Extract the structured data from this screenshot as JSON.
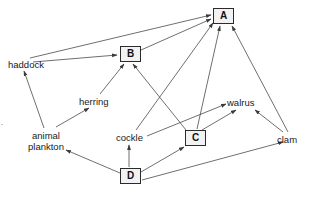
{
  "diagram": {
    "type": "directed-graph",
    "stroke_color": "#4a4a4a",
    "box_fill": "#f2f2f2",
    "box_stroke": "#2b2b2b",
    "background": "#ffffff",
    "boxed_nodes": [
      {
        "id": "A",
        "label": "A",
        "x": 213,
        "y": 8,
        "w": 21,
        "h": 16
      },
      {
        "id": "B",
        "label": "B",
        "x": 120,
        "y": 46,
        "w": 21,
        "h": 16
      },
      {
        "id": "C",
        "label": "C",
        "x": 185,
        "y": 130,
        "w": 21,
        "h": 16
      },
      {
        "id": "D",
        "label": "D",
        "x": 120,
        "y": 168,
        "w": 21,
        "h": 16
      }
    ],
    "text_nodes": [
      {
        "id": "haddock",
        "label": "haddock",
        "x": 8,
        "y": 59
      },
      {
        "id": "herring",
        "label": "herring",
        "x": 79,
        "y": 96
      },
      {
        "id": "plankton",
        "label": "animal\nplankton",
        "x": 28,
        "y": 130
      },
      {
        "id": "cockle",
        "label": "cockle",
        "x": 116,
        "y": 132
      },
      {
        "id": "walrus",
        "label": "walrus",
        "x": 227,
        "y": 97
      },
      {
        "id": "clam",
        "label": "clam",
        "x": 277,
        "y": 134
      }
    ],
    "edges": [
      {
        "from": "haddock",
        "to": "A",
        "x1": 30,
        "y1": 58,
        "x2": 211,
        "y2": 15
      },
      {
        "from": "haddock",
        "to": "B",
        "x1": 33,
        "y1": 62,
        "x2": 117,
        "y2": 55
      },
      {
        "from": "plankton",
        "to": "haddock",
        "x1": 44,
        "y1": 128,
        "x2": 24,
        "y2": 71
      },
      {
        "from": "plankton",
        "to": "herring",
        "x1": 56,
        "y1": 127,
        "x2": 89,
        "y2": 108
      },
      {
        "from": "herring",
        "to": "B",
        "x1": 100,
        "y1": 94,
        "x2": 124,
        "y2": 64
      },
      {
        "from": "B",
        "to": "A",
        "x1": 141,
        "y1": 50,
        "x2": 211,
        "y2": 19
      },
      {
        "from": "cockle",
        "to": "A",
        "x1": 136,
        "y1": 130,
        "x2": 213,
        "y2": 23
      },
      {
        "from": "cockle",
        "to": "walrus",
        "x1": 147,
        "y1": 136,
        "x2": 226,
        "y2": 104
      },
      {
        "from": "C",
        "to": "B",
        "x1": 186,
        "y1": 130,
        "x2": 133,
        "y2": 64
      },
      {
        "from": "C",
        "to": "A",
        "x1": 197,
        "y1": 129,
        "x2": 220,
        "y2": 26
      },
      {
        "from": "C",
        "to": "walrus",
        "x1": 202,
        "y1": 130,
        "x2": 236,
        "y2": 110
      },
      {
        "from": "clam",
        "to": "A",
        "x1": 288,
        "y1": 132,
        "x2": 232,
        "y2": 26
      },
      {
        "from": "clam",
        "to": "walrus",
        "x1": 283,
        "y1": 132,
        "x2": 255,
        "y2": 110
      },
      {
        "from": "D",
        "to": "cockle",
        "x1": 129,
        "y1": 167,
        "x2": 129,
        "y2": 145
      },
      {
        "from": "D",
        "to": "C",
        "x1": 141,
        "y1": 172,
        "x2": 184,
        "y2": 147
      },
      {
        "from": "D",
        "to": "plankton",
        "x1": 120,
        "y1": 173,
        "x2": 66,
        "y2": 150
      },
      {
        "from": "D",
        "to": "clam",
        "x1": 142,
        "y1": 180,
        "x2": 283,
        "y2": 142
      }
    ]
  }
}
